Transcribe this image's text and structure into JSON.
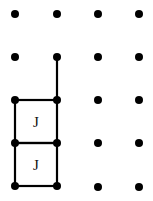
{
  "diagram": {
    "type": "dot-grid",
    "columns_x": [
      15,
      57,
      98,
      139
    ],
    "rows_y": [
      14,
      57,
      100,
      143,
      186
    ],
    "dot_color": "#000000",
    "line_color": "#000000",
    "shapes": [
      {
        "name": "square-upper",
        "label": "J"
      },
      {
        "name": "square-lower",
        "label": "J"
      }
    ],
    "extra_segment": "vertical line from row 2 to row 3 at column 2"
  }
}
